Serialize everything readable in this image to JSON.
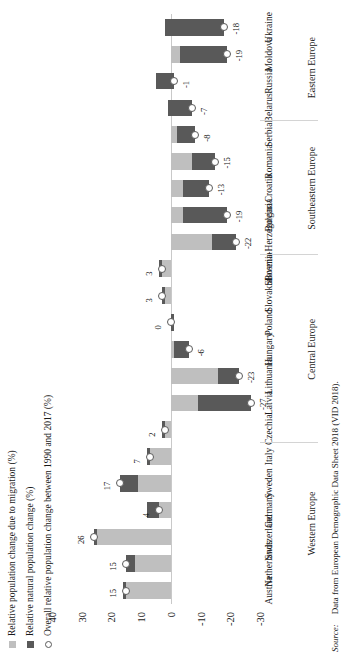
{
  "legend": {
    "items": [
      {
        "key": "migration",
        "label": "Relative population change due to migration (%)",
        "marker": "square-swatch",
        "color": "#bfbfbf"
      },
      {
        "key": "natural",
        "label": "Relative natural population change (%)",
        "marker": "square-swatch",
        "color": "#595959"
      },
      {
        "key": "overall",
        "label": "Overall relative population change between 1990 and 2017 (%)",
        "marker": "circle-outline",
        "color": "#5a5a5a"
      }
    ]
  },
  "axis": {
    "ticks": [
      40,
      30,
      20,
      10,
      0,
      -10,
      -20,
      -30
    ],
    "min": -30,
    "max": 40
  },
  "source": {
    "label": "Source:",
    "text": "Data from European Demographic Data Sheet 2018 (VID 2018)."
  },
  "groups": [
    {
      "name": "Western Europe",
      "countries": [
        "Austria",
        "Netherlands",
        "Switzerland",
        "Germany",
        "Sweden",
        "Italy"
      ]
    },
    {
      "name": "Central Europe",
      "countries": [
        "Czechia",
        "Latvia",
        "Lithuania",
        "Hungary",
        "Poland",
        "Slovakia",
        "Slovenia"
      ]
    },
    {
      "name": "Southeastern Europe",
      "countries": [
        "Bosnia-Herzegovina",
        "Bulgaria",
        "Croatia",
        "Romania",
        "Serbia"
      ]
    },
    {
      "name": "Eastern Europe",
      "countries": [
        "Belarus",
        "Russia",
        "Moldova",
        "Ukraine"
      ]
    }
  ],
  "chart_data": {
    "type": "bar",
    "title": "",
    "xlabel": "",
    "ylabel": "",
    "ylim": [
      -30,
      40
    ],
    "grid": false,
    "legend_position": "top-left",
    "orientation": "vertical-bars-rotated",
    "categories": [
      "Austria",
      "Netherlands",
      "Switzerland",
      "Germany",
      "Sweden",
      "Italy",
      "Czechia",
      "Latvia",
      "Lithuania",
      "Hungary",
      "Poland",
      "Slovakia",
      "Slovenia",
      "Bosnia-Herzegovina",
      "Bulgaria",
      "Croatia",
      "Romania",
      "Serbia",
      "Belarus",
      "Russia",
      "Moldova",
      "Ukraine"
    ],
    "group_of_category": [
      "Western Europe",
      "Western Europe",
      "Western Europe",
      "Western Europe",
      "Western Europe",
      "Western Europe",
      "Central Europe",
      "Central Europe",
      "Central Europe",
      "Central Europe",
      "Central Europe",
      "Central Europe",
      "Central Europe",
      "Southeastern Europe",
      "Southeastern Europe",
      "Southeastern Europe",
      "Southeastern Europe",
      "Southeastern Europe",
      "Eastern Europe",
      "Eastern Europe",
      "Eastern Europe",
      "Eastern Europe"
    ],
    "series": [
      {
        "name": "Relative population change due to migration (%)",
        "color": "#bfbfbf",
        "values": [
          16,
          12,
          25,
          8,
          11,
          8,
          3,
          -9,
          -16,
          -1,
          -1,
          2,
          4,
          -14,
          -4,
          -4,
          -7,
          -2,
          1,
          5,
          -3,
          2
        ]
      },
      {
        "name": "Relative natural population change (%)",
        "color": "#595959",
        "values": [
          -1,
          3,
          1,
          -4,
          6,
          -1,
          -1,
          -18,
          -7,
          -5,
          1,
          1,
          -1,
          -8,
          -15,
          -9,
          -8,
          -6,
          -8,
          -6,
          -16,
          -20
        ]
      },
      {
        "name": "Overall relative population change between 1990 and 2017 (%)",
        "color": "#5a5a5a",
        "marker": "circle",
        "values": [
          15,
          15,
          26,
          4,
          17,
          7,
          2,
          -27,
          -23,
          -6,
          0,
          3,
          3,
          -22,
          -19,
          -13,
          -15,
          -8,
          -7,
          -1,
          -19,
          -18
        ]
      }
    ],
    "data_labels": [
      {
        "category": "Austria",
        "value": 15,
        "text": "15"
      },
      {
        "category": "Netherlands",
        "value": 15,
        "text": "15"
      },
      {
        "category": "Switzerland",
        "value": 26,
        "text": "26"
      },
      {
        "category": "Germany",
        "value": 4,
        "text": "4"
      },
      {
        "category": "Sweden",
        "value": 17,
        "text": "17"
      },
      {
        "category": "Italy",
        "value": 7,
        "text": "7"
      },
      {
        "category": "Czechia",
        "value": 2,
        "text": "2"
      },
      {
        "category": "Latvia",
        "value": -27,
        "text": "-27"
      },
      {
        "category": "Lithuania",
        "value": -23,
        "text": "-23"
      },
      {
        "category": "Hungary",
        "value": -6,
        "text": "-6"
      },
      {
        "category": "Poland",
        "value": 0,
        "text": "0"
      },
      {
        "category": "Slovakia",
        "value": 3,
        "text": "3"
      },
      {
        "category": "Slovenia",
        "value": 3,
        "text": "3"
      },
      {
        "category": "Bosnia-Herzegovina",
        "value": -22,
        "text": "-22"
      },
      {
        "category": "Bulgaria",
        "value": -19,
        "text": "-19"
      },
      {
        "category": "Croatia",
        "value": -13,
        "text": "-13"
      },
      {
        "category": "Romania",
        "value": -15,
        "text": "-15"
      },
      {
        "category": "Serbia",
        "value": -8,
        "text": "-8"
      },
      {
        "category": "Belarus",
        "value": -7,
        "text": "-7"
      },
      {
        "category": "Russia",
        "value": -1,
        "text": "-1"
      },
      {
        "category": "Moldova",
        "value": -19,
        "text": "-19"
      },
      {
        "category": "Ukraine",
        "value": -18,
        "text": "-18"
      }
    ]
  }
}
